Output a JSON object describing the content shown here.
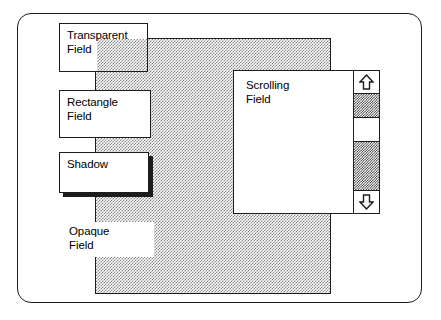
{
  "diagram": {
    "frame": {
      "shape": "rounded-rectangle"
    },
    "background_pattern": {
      "name": "pattern-rectangle",
      "fill": "50% gray checkerboard dither",
      "color": "#8a8a8a"
    },
    "fields": [
      {
        "id": "transparent",
        "label": "Transparent\nField",
        "style": "bordered, transparent fill (pattern shows through)"
      },
      {
        "id": "rectangle",
        "label": "Rectangle\nField",
        "style": "bordered, opaque white fill"
      },
      {
        "id": "shadow",
        "label": "Shadow",
        "style": "bordered, opaque white fill, hard drop shadow"
      },
      {
        "id": "opaque",
        "label": "Opaque\nField",
        "style": "no border, opaque white fill"
      },
      {
        "id": "scrolling",
        "label": "Scrolling\nField",
        "style": "bordered, opaque white fill, with vertical scroll bar"
      }
    ],
    "scrollbar": {
      "name": "vertical-scrollbar",
      "up_arrow": "scroll-up-arrow",
      "down_arrow": "scroll-down-arrow",
      "thumb": "scroll-thumb",
      "track_fill": "dark checkerboard dither",
      "track_color": "#2a2a2a"
    },
    "colors": {
      "ink": "#1d1d1d",
      "paper": "#ffffff",
      "pattern_light": "#8a8a8a",
      "pattern_dark": "#2a2a2a"
    }
  }
}
